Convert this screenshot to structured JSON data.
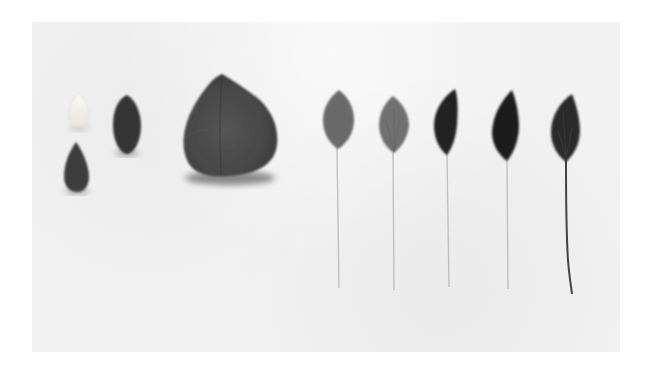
{
  "image": {
    "description": "Photograph of a row of objects on white paper: two small seeds (one white, one dark), a dark almond-shaped seed, a large dark rounded leaf/petal, and five feathers with thin quills ranging from light grey to black",
    "background_color": "#f2f2f2",
    "page_color": "#ffffff",
    "objects": [
      {
        "name": "white-seed",
        "color": "#f4f1ea"
      },
      {
        "name": "dark-teardrop-seed",
        "color": "#3e3e3e"
      },
      {
        "name": "dark-almond-seed",
        "color": "#353535"
      },
      {
        "name": "large-petal",
        "color": "#4a4a4a"
      },
      {
        "name": "feather-1",
        "color": "#6a6a6a"
      },
      {
        "name": "feather-2",
        "color": "#707070"
      },
      {
        "name": "feather-3",
        "color": "#222222"
      },
      {
        "name": "feather-4",
        "color": "#1c1c1c"
      },
      {
        "name": "feather-5",
        "color": "#2a2a2a"
      }
    ]
  }
}
